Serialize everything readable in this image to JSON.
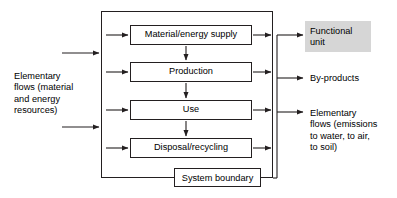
{
  "diagram": {
    "boundary_label": "System boundary",
    "colors": {
      "stroke": "#231f20",
      "text": "#000000",
      "background": "#ffffff",
      "highlight": "#d6d6d6"
    }
  },
  "processes": [
    {
      "id": "material-energy-supply",
      "label": "Material/energy supply"
    },
    {
      "id": "production",
      "label": "Production"
    },
    {
      "id": "use",
      "label": "Use"
    },
    {
      "id": "disposal-recycling",
      "label": "Disposal/recycling"
    }
  ],
  "inputs": {
    "label": "Elementary\nflows (material\nand energy\nresources)",
    "arrow_count_outer": 2,
    "arrow_count_inner": 4
  },
  "outputs": [
    {
      "id": "functional-unit",
      "label": "Functional\nunit",
      "highlighted": true
    },
    {
      "id": "by-products",
      "label": "By-products",
      "highlighted": false
    },
    {
      "id": "elementary-flows-out",
      "label": "Elementary\nflows (emissions\nto water, to air,\nto soil)",
      "highlighted": false
    }
  ],
  "connections": {
    "vertical_flow": "top-to-bottom between process boxes",
    "outer_output_arrow_count": 3,
    "inner_output_arrow_count": 4
  }
}
